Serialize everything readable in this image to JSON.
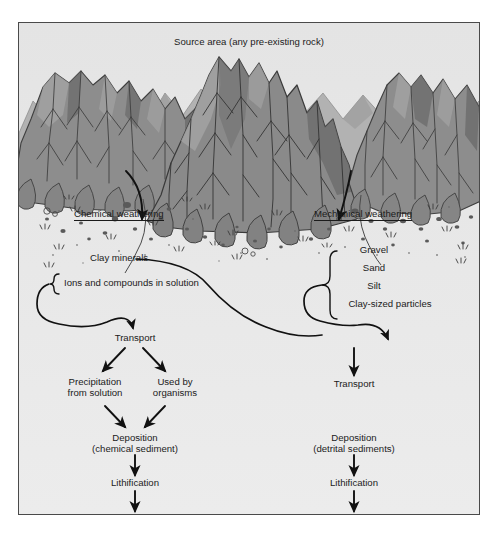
{
  "diagram": {
    "title": "Source area (any pre-existing rock)",
    "colors": {
      "frame_border": "#4a4a4a",
      "panel_background": "#e9e9e9",
      "mountain_light": "#9b9b9b",
      "mountain_mid": "#8a8a8a",
      "mountain_dark": "#6f6f6f",
      "mountain_far": "#adadad",
      "ink": "#1b1b1b",
      "page_background": "#ffffff"
    },
    "branches": {
      "chemical": {
        "heading": "Chemical weathering",
        "products": {
          "clay": "Clay minerals",
          "ions": "Ions and compounds in solution"
        },
        "transport": "Transport",
        "paths": [
          {
            "line1": "Precipitation",
            "line2": "from solution"
          },
          {
            "line1": "Used by",
            "line2": "organisms"
          }
        ],
        "deposition": {
          "line1": "Deposition",
          "line2": "(chemical sediment)"
        },
        "lithification": "Lithification",
        "result": {
          "line1": "Chemical sedimentary rock",
          "line2": "(e.g., limestone)"
        }
      },
      "mechanical": {
        "heading": "Mechanical weathering",
        "products": [
          "Gravel",
          "Sand",
          "Silt",
          "Clay-sized particles"
        ],
        "transport": "Transport",
        "deposition": {
          "line1": "Deposition",
          "line2": "(detrital sediments)"
        },
        "lithification": "Lithification",
        "result": {
          "line1": "Detrital sedimentary rocks",
          "line2": "(e.g., sandstone)"
        }
      }
    }
  }
}
